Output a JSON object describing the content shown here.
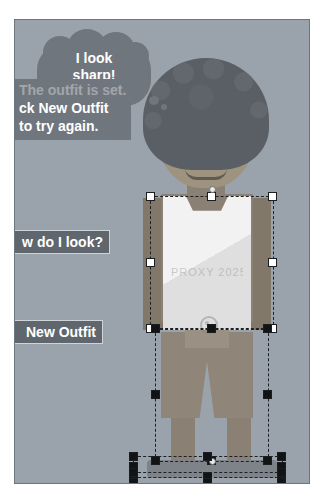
{
  "app": {
    "kind": "character-dress-up-stage"
  },
  "stage": {
    "background_color": "#9aa3ab",
    "border_color": "#6e767d"
  },
  "speech": {
    "bubble_text": "I look sharp!",
    "bubble_line1": "I look",
    "bubble_line2": "sharp!"
  },
  "hint": {
    "faded_line": "The outfit is set.",
    "line1": "ck New Outfit",
    "line2": "to try again.",
    "full_text": "Click New Outfit to try again."
  },
  "buttons": [
    {
      "id": "how-do-i-look",
      "label": "How do I look?",
      "visible_label": "w do I look?"
    },
    {
      "id": "new-outfit",
      "label": "New Outfit",
      "visible_label": "New Outfit"
    }
  ],
  "character": {
    "name": "dress-up-avatar",
    "hair_color": "#5a5f66",
    "skin_color": "#9e937f",
    "shirt_color": "#f2f2f2",
    "shorts_color": "#8f8579",
    "shoe_color": "#7d8389",
    "shirt_mark_text": "PROXY 2025"
  },
  "selection": {
    "handle_fill": "#ffffff",
    "handle_filled": "#111315",
    "outline_style": "dashed",
    "outline_color": "#1d2023",
    "boxes": [
      {
        "id": "shirt-selection",
        "label": "Shirt"
      },
      {
        "id": "shorts-selection",
        "label": "Shorts"
      },
      {
        "id": "shoes-selection",
        "label": "Shoes"
      },
      {
        "id": "shoes-selection-2",
        "label": "Shoe soles"
      }
    ]
  }
}
